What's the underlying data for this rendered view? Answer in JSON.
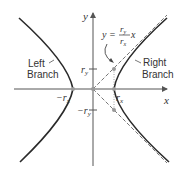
{
  "diagram": {
    "axes": {
      "x_label": "x",
      "y_label": "y"
    },
    "ticks": {
      "r_x": "r",
      "r_x_sub": "x",
      "neg_r_x": "−r",
      "neg_r_x_sub": "x",
      "r_y": "r",
      "r_y_sub": "y",
      "neg_r_y": "−r",
      "neg_r_y_sub": "y"
    },
    "branches": {
      "left_line1": "Left",
      "left_line2": "Branch",
      "right_line1": "Right",
      "right_line2": "Branch"
    },
    "asymptote_equation": {
      "lhs": "y =",
      "numerator": "r",
      "numerator_sub": "y",
      "denominator": "r",
      "denominator_sub": "x",
      "variable": "x"
    },
    "colors": {
      "curve": "#2a2a2a",
      "axis": "#555555",
      "dashed": "#777777",
      "point": "#999999"
    }
  }
}
